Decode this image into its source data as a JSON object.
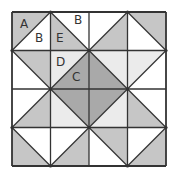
{
  "diagram": {
    "type": "quilt-block",
    "grid": {
      "rows": 4,
      "cols": 4
    },
    "colors": {
      "white": "#ffffff",
      "medium": "#c6c6c6",
      "light": "#ebebeb",
      "dark": "#a9a9a9",
      "line": "#333333"
    },
    "cells": [
      {
        "r": 0,
        "c": 0,
        "diag": "/",
        "a": "medium",
        "b": "white"
      },
      {
        "r": 0,
        "c": 1,
        "diag": "\\",
        "a": "white",
        "b": "medium"
      },
      {
        "r": 0,
        "c": 2,
        "diag": "/",
        "a": "white",
        "b": "medium"
      },
      {
        "r": 0,
        "c": 3,
        "diag": "\\",
        "a": "medium",
        "b": "white"
      },
      {
        "r": 1,
        "c": 0,
        "diag": "\\",
        "a": "medium",
        "b": "white"
      },
      {
        "r": 1,
        "c": 1,
        "diag": "/",
        "a": "light",
        "b": "dark"
      },
      {
        "r": 1,
        "c": 2,
        "diag": "\\",
        "a": "light",
        "b": "dark"
      },
      {
        "r": 1,
        "c": 3,
        "diag": "/",
        "a": "light",
        "b": "white"
      },
      {
        "r": 2,
        "c": 0,
        "diag": "/",
        "a": "white",
        "b": "medium"
      },
      {
        "r": 2,
        "c": 1,
        "diag": "\\",
        "a": "dark",
        "b": "light"
      },
      {
        "r": 2,
        "c": 2,
        "diag": "/",
        "a": "dark",
        "b": "light"
      },
      {
        "r": 2,
        "c": 3,
        "diag": "\\",
        "a": "white",
        "b": "medium"
      },
      {
        "r": 3,
        "c": 0,
        "diag": "\\",
        "a": "white",
        "b": "medium"
      },
      {
        "r": 3,
        "c": 1,
        "diag": "/",
        "a": "white",
        "b": "medium"
      },
      {
        "r": 3,
        "c": 2,
        "diag": "\\",
        "a": "medium",
        "b": "white"
      },
      {
        "r": 3,
        "c": 3,
        "diag": "/",
        "a": "white",
        "b": "medium"
      }
    ],
    "labels": [
      {
        "text": "A",
        "x": 20,
        "y": 28
      },
      {
        "text": "B",
        "x": 35,
        "y": 42
      },
      {
        "text": "B",
        "x": 74,
        "y": 24
      },
      {
        "text": "E",
        "x": 56,
        "y": 42
      },
      {
        "text": "D",
        "x": 56,
        "y": 66
      },
      {
        "text": "C",
        "x": 72,
        "y": 81
      }
    ]
  }
}
